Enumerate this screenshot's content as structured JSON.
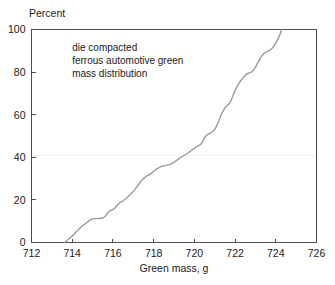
{
  "chart_data": {
    "type": "line",
    "title": "",
    "subtitle": "",
    "xlabel": "Green mass, g",
    "ylabel": "Percent",
    "xlim": [
      712,
      726
    ],
    "ylim": [
      0,
      100
    ],
    "xticks": [
      712,
      714,
      716,
      718,
      720,
      722,
      724,
      726
    ],
    "xtick_labels": [
      "712",
      "714",
      "716",
      "718",
      "720",
      "722",
      "724",
      "726"
    ],
    "yticks": [
      0,
      20,
      40,
      60,
      80,
      100
    ],
    "ytick_labels": [
      "0",
      "20",
      "40",
      "60",
      "80",
      "100"
    ],
    "grid": false,
    "legend": "none",
    "series": [
      {
        "name": "die compacted ferrous automotive green mass distribution",
        "color": "#9a9a9a",
        "x": [
          713.62,
          713.78,
          713.95,
          714.12,
          714.3,
          714.45,
          714.6,
          714.72,
          714.85,
          714.95,
          715.08,
          715.3,
          715.5,
          715.62,
          715.7,
          715.8,
          715.92,
          716.02,
          716.12,
          716.22,
          716.35,
          716.5,
          716.62,
          716.75,
          716.9,
          717.05,
          717.2,
          717.35,
          717.5,
          717.62,
          717.75,
          717.9,
          718.05,
          718.2,
          718.4,
          718.6,
          718.85,
          719.05,
          719.25,
          719.45,
          719.65,
          719.85,
          720.0,
          720.15,
          720.3,
          720.42,
          720.5,
          720.6,
          720.75,
          720.9,
          721.02,
          721.12,
          721.22,
          721.3,
          721.4,
          721.5,
          721.6,
          721.7,
          721.8,
          721.9,
          722.0,
          722.12,
          722.25,
          722.4,
          722.55,
          722.7,
          722.85,
          723.0,
          723.12,
          723.25,
          723.4,
          723.55,
          723.7,
          723.85,
          724.0,
          724.15,
          724.3
        ],
        "y": [
          0.0,
          1.2,
          2.6,
          4.2,
          6.0,
          7.4,
          8.5,
          9.4,
          10.4,
          11.0,
          11.2,
          11.3,
          11.5,
          12.2,
          13.4,
          14.6,
          15.2,
          15.6,
          16.4,
          17.6,
          18.8,
          19.6,
          20.4,
          21.6,
          23.0,
          24.6,
          26.4,
          28.4,
          30.0,
          31.0,
          31.6,
          32.6,
          33.8,
          34.8,
          35.8,
          36.2,
          36.8,
          38.0,
          39.4,
          40.6,
          41.8,
          43.2,
          44.2,
          45.2,
          46.0,
          47.4,
          49.2,
          50.4,
          51.2,
          52.0,
          53.4,
          55.2,
          57.4,
          59.6,
          61.6,
          63.2,
          64.2,
          65.0,
          66.6,
          69.0,
          71.4,
          73.6,
          75.6,
          77.4,
          79.0,
          79.6,
          80.2,
          82.2,
          84.6,
          86.8,
          88.6,
          89.6,
          90.2,
          91.4,
          93.6,
          96.4,
          100.0
        ]
      }
    ],
    "annotations": [
      {
        "id": "dist-note",
        "lines": [
          "die compacted",
          "ferrous automotive green",
          "mass distribution"
        ],
        "x": 714.0,
        "y": 90
      }
    ]
  },
  "axes": {
    "y_axis_caption": "Percent",
    "x_axis_caption": "Green mass, g"
  },
  "colors": {
    "series": "#9a9a9a",
    "frame": "#4d4d4d",
    "text": "#1a1a1a",
    "background": "#ffffff"
  }
}
